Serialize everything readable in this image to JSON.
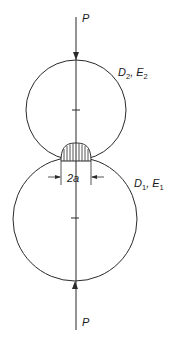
{
  "diagram": {
    "force_top": {
      "label": "P",
      "direction": "down"
    },
    "force_bottom": {
      "label": "P",
      "direction": "up"
    },
    "upper_body": {
      "label": "D",
      "sub1": "2",
      "sep": ", E",
      "sub2": "2"
    },
    "lower_body": {
      "label": "D",
      "sub1": "1",
      "sep": ", E",
      "sub2": "1"
    },
    "contact_width": {
      "label": "2a"
    },
    "colors": {
      "stroke": "#2a2a2a",
      "background": "#ffffff"
    }
  }
}
